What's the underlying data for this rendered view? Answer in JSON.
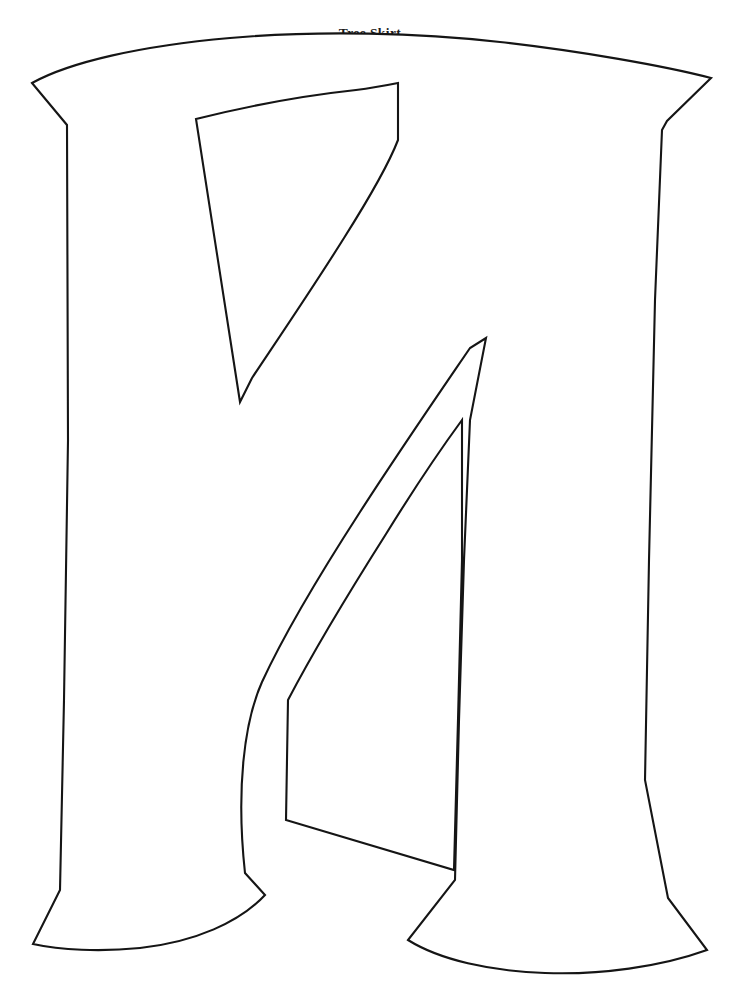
{
  "document": {
    "title": "Tree Skirt",
    "background_color": "#ffffff",
    "ink_color": "#151515",
    "page_width": 740,
    "page_height": 990,
    "kind": "printable-letter-template"
  },
  "header": {
    "title": "Tree Skirt"
  },
  "template": {
    "name": "letter-template-outline",
    "letter": "M",
    "style": "serif-slab flared stems, two triangular counters",
    "fill": "#ffffff",
    "stroke": "#151515",
    "stroke_width": 2.1,
    "outer_path": "M 32 83 C 120 44 300 30 455 42 C 575 52 665 65 711 78 L 667 121 L 661 123 L 652 270 L 648 520 L 644 760 L 668 898 L 707 950 C 640 972 520 978 460 960 C 430 951 410 940 400 928 L 450 880 L 456 700 L 462 520 L 485 338 L 470 346 L 380 500 L 300 640 L 245 873 L 266 896 C 250 925 190 948 130 949 C 90 950 55 947 33 944 L 60 890 L 66 700 L 70 440 L 67 125 Z",
    "counter_upper_path": "M 196 120 L 240 402 L 290 330 L 360 215 L 398 140 L 398 82 C 340 86 270 98 230 110 Z",
    "counter_lower_path": "M 0 0"
  },
  "icons": {
    "outline_shape": "letter-outline-shape"
  }
}
